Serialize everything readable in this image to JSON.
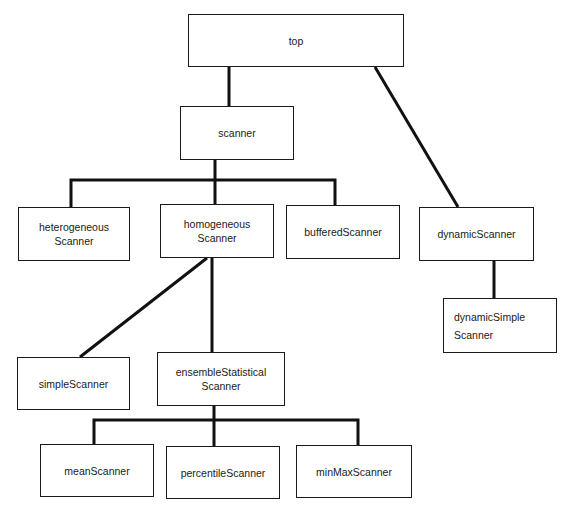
{
  "diagram": {
    "type": "class-hierarchy-tree",
    "nodes": [
      {
        "id": "top",
        "label": "top",
        "x": 188,
        "y": 14,
        "w": 216,
        "h": 53
      },
      {
        "id": "scanner",
        "label": "scanner",
        "x": 180,
        "y": 106,
        "w": 114,
        "h": 54
      },
      {
        "id": "heterogeneousScanner",
        "label": "heterogeneous\nScanner",
        "x": 18,
        "y": 207,
        "w": 112,
        "h": 54
      },
      {
        "id": "homogeneousScanner",
        "label": "homogeneous\nScanner",
        "x": 160,
        "y": 204,
        "w": 114,
        "h": 54
      },
      {
        "id": "bufferedScanner",
        "label": "bufferedScanner",
        "x": 286,
        "y": 205,
        "w": 114,
        "h": 54
      },
      {
        "id": "dynamicScanner",
        "label": "dynamicScanner",
        "x": 419,
        "y": 207,
        "w": 115,
        "h": 54
      },
      {
        "id": "dynamicSimpleScanner",
        "label": "dynamicSimple\nScanner",
        "x": 443,
        "y": 298,
        "w": 114,
        "h": 55
      },
      {
        "id": "simpleScanner",
        "label": "simpleScanner",
        "x": 17,
        "y": 357,
        "w": 113,
        "h": 53
      },
      {
        "id": "ensembleStatisticalScanner",
        "label": "ensembleStatistical\nScanner",
        "x": 157,
        "y": 352,
        "w": 128,
        "h": 54
      },
      {
        "id": "meanScanner",
        "label": "meanScanner",
        "x": 40,
        "y": 444,
        "w": 114,
        "h": 53
      },
      {
        "id": "percentileScanner",
        "label": "percentileScanner",
        "x": 166,
        "y": 446,
        "w": 114,
        "h": 53
      },
      {
        "id": "minMaxScanner",
        "label": "minMaxScanner",
        "x": 296,
        "y": 445,
        "w": 116,
        "h": 53
      }
    ],
    "edges": [
      {
        "from": "top",
        "to": "scanner"
      },
      {
        "from": "top",
        "to": "dynamicScanner"
      },
      {
        "from": "scanner",
        "to": "heterogeneousScanner"
      },
      {
        "from": "scanner",
        "to": "homogeneousScanner"
      },
      {
        "from": "scanner",
        "to": "bufferedScanner"
      },
      {
        "from": "homogeneousScanner",
        "to": "simpleScanner"
      },
      {
        "from": "homogeneousScanner",
        "to": "ensembleStatisticalScanner"
      },
      {
        "from": "dynamicScanner",
        "to": "dynamicSimpleScanner"
      },
      {
        "from": "ensembleStatisticalScanner",
        "to": "meanScanner"
      },
      {
        "from": "ensembleStatisticalScanner",
        "to": "percentileScanner"
      },
      {
        "from": "ensembleStatisticalScanner",
        "to": "minMaxScanner"
      }
    ]
  },
  "labels": {
    "top": "top",
    "scanner": "scanner",
    "heterogeneousScanner": "heterogeneous\nScanner",
    "homogeneousScanner": "homogeneous\nScanner",
    "bufferedScanner": "bufferedScanner",
    "dynamicScanner": "dynamicScanner",
    "dynamicSimpleScanner": "dynamicSimple\nScanner",
    "simpleScanner": "simpleScanner",
    "ensembleStatisticalScanner": "ensembleStatistical\nScanner",
    "meanScanner": "meanScanner",
    "percentileScanner": "percentileScanner",
    "minMaxScanner": "minMaxScanner"
  },
  "style": {
    "line_color": "#111111",
    "box_border_color": "#1a1a1a",
    "background": "#ffffff"
  }
}
